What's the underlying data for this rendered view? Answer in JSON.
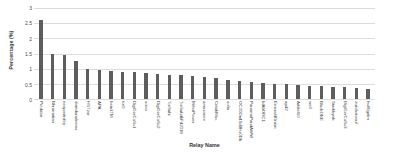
{
  "chart_data": {
    "type": "bar",
    "title": "",
    "xlabel": "Relay Name",
    "ylabel": "Percentage (%)",
    "ylim": [
      0,
      3
    ],
    "yticks": [
      0,
      0.5,
      1,
      1.5,
      2,
      2.5,
      3
    ],
    "ytick_labels": [
      "0",
      "0.5",
      "1",
      "1.5",
      "2",
      "2.5",
      "3"
    ],
    "grid": true,
    "legend": "none",
    "bar_color": "#5d5d5d",
    "gridline_color": "#dcdcdc",
    "categories": [
      "Predator",
      "Bhramatian",
      "neopostniley",
      "dorridunalnews",
      "HSTzor",
      "APA",
      "hein1TM",
      "tor0",
      "DigiGerCoSx1",
      "sorxx",
      "DigiGerCoSx2",
      "TorSubi",
      "TorSubdkFd2018",
      "MillerPower",
      "amazonee",
      "CritakMax",
      "sofia",
      "OCZ0Dn4Sd9Hz0Db",
      "PanamaPandAWW",
      "bIAbORC1",
      "EmeraldOnion",
      "apd2",
      "Artikel10",
      "wo0",
      "BlackONE",
      "Starkbynb",
      "DigiGerCoSx3",
      "zwiebotoouf",
      "hwlNgalm"
    ],
    "values": [
      2.6,
      1.5,
      1.45,
      1.25,
      1.0,
      0.95,
      0.92,
      0.9,
      0.88,
      0.86,
      0.84,
      0.8,
      0.78,
      0.75,
      0.72,
      0.68,
      0.62,
      0.58,
      0.55,
      0.52,
      0.5,
      0.48,
      0.46,
      0.44,
      0.42,
      0.4,
      0.38,
      0.35,
      0.33
    ]
  }
}
